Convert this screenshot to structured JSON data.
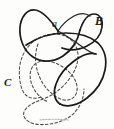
{
  "figure": {
    "kind": "hand-drawn-curve-diagram",
    "width": 114,
    "height": 129,
    "background_color": "#fdfdfc"
  },
  "labels": {
    "point_a": "a",
    "curve_b": "B",
    "curve_c": "C"
  },
  "colors": {
    "solid_stroke": "#1b1a19",
    "dashed_stroke": "#4a4844",
    "smudge": "#b9b5ad",
    "background": "#fdfdfc"
  },
  "curves": [
    {
      "name": "curve-b-solid",
      "style": "solid",
      "label": "B",
      "closed": true,
      "self_intersecting": true
    },
    {
      "name": "curve-c-dashed",
      "style": "dashed",
      "label": "C",
      "closed": true,
      "self_intersecting": true
    }
  ],
  "annotations": {
    "marked_point": "a"
  }
}
